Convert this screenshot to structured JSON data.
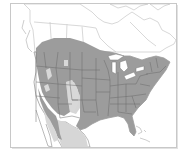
{
  "map": {
    "title": "",
    "region": "North America",
    "frame": {
      "x": 10,
      "y": 3,
      "width": 167,
      "height": 145,
      "border_color": "#c8c8c8"
    },
    "colors": {
      "background": "#ffffff",
      "land": "#ffffff",
      "range_primary": "#9a9a9a",
      "range_secondary": "#d8d8d8",
      "borders": "#6e6e6e",
      "canada_borders": "#bdbdbd"
    },
    "legend": [
      {
        "label": "Range (present)",
        "color": "#9a9a9a"
      },
      {
        "label": "Range (sparse/absent)",
        "color": "#d8d8d8"
      }
    ]
  }
}
